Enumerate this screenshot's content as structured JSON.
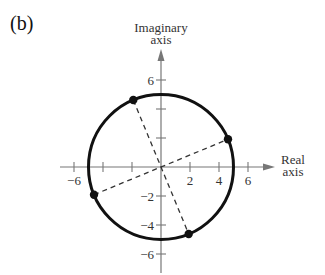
{
  "panel_label": "(b)",
  "axes": {
    "y_title_line1": "Imaginary",
    "y_title_line2": "axis",
    "x_title_line1": "Real",
    "x_title_line2": "axis",
    "x_ticks": [
      {
        "value": -6,
        "label": "−6"
      },
      {
        "value": -4,
        "label": ""
      },
      {
        "value": -2,
        "label": ""
      },
      {
        "value": 2,
        "label": "2"
      },
      {
        "value": 4,
        "label": "4"
      },
      {
        "value": 6,
        "label": "6"
      }
    ],
    "y_ticks": [
      {
        "value": 6,
        "label": "6"
      },
      {
        "value": 4,
        "label": ""
      },
      {
        "value": 2,
        "label": ""
      },
      {
        "value": -2,
        "label": "−2"
      },
      {
        "value": -4,
        "label": "−4"
      },
      {
        "value": -6,
        "label": "−6"
      }
    ],
    "color": "#777777"
  },
  "circle": {
    "center": [
      0,
      0
    ],
    "radius": 5,
    "color": "#111111"
  },
  "points": [
    {
      "x": 4.62,
      "y": 1.91
    },
    {
      "x": -1.91,
      "y": 4.62
    },
    {
      "x": -4.62,
      "y": -1.91
    },
    {
      "x": 1.91,
      "y": -4.62
    }
  ],
  "dashed_segments": [
    {
      "from": [
        -4.62,
        -1.91
      ],
      "to": [
        4.62,
        1.91
      ]
    },
    {
      "from": [
        -1.91,
        4.62
      ],
      "to": [
        1.91,
        -4.62
      ]
    }
  ]
}
